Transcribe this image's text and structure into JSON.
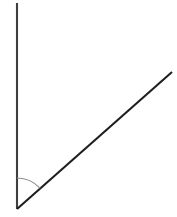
{
  "figure": {
    "kind": "angle-diagram",
    "canvas": {
      "width": 177,
      "height": 217,
      "background_color": "#ffffff"
    },
    "vertex": {
      "label": "vertex",
      "x": 17,
      "y": 209
    },
    "rays": [
      {
        "name": "vertical-ray",
        "description": "vertical ray pointing up from the vertex",
        "x1": 17,
        "y1": 209,
        "x2": 17,
        "y2": 3,
        "length_px": 206,
        "direction_deg": 90,
        "color": "#3f3f3f",
        "stroke_width": 2.1
      },
      {
        "name": "diagonal-ray",
        "description": "diagonal ray rising to the upper right from the vertex",
        "x1": 17,
        "y1": 209,
        "x2": 172,
        "y2": 72,
        "length_px": 207,
        "direction_deg": 41.5,
        "color": "#1e1e1e",
        "stroke_width": 2.1
      }
    ],
    "arc": {
      "name": "angle-arc",
      "description": "light gray arc marking the interior angle at the vertex",
      "center_x": 17,
      "center_y": 209,
      "radius": 31,
      "start_deg": 90,
      "end_deg": 41.5,
      "sweep_deg": 48.5,
      "color": "#8f8f8f",
      "stroke_width": 1.2
    },
    "measurements": {
      "angle_between_rays_deg": 48.5
    }
  }
}
